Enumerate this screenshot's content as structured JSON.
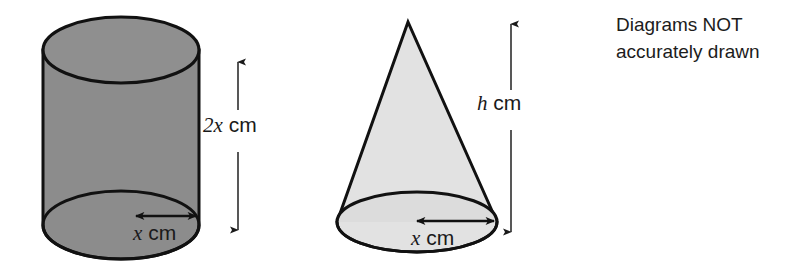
{
  "figure": {
    "title_note": {
      "line1": "Diagrams NOT",
      "line2": "accurately drawn"
    },
    "colors": {
      "cylinder_fill": "#8c8c8c",
      "cylinder_top_fill": "#8f8f8f",
      "cone_fill": "#e2e2e2",
      "cone_base_fill": "#dcdcdc",
      "outline": "#111111",
      "text": "#1a1a1a",
      "background": "#ffffff"
    },
    "shapes": [
      {
        "name": "cylinder",
        "fill": "#8c8c8c",
        "height_label_var": "2x",
        "height_label_unit": " cm",
        "radius_label_var": "x",
        "radius_label_unit": " cm"
      },
      {
        "name": "cone",
        "fill": "#e2e2e2",
        "height_label_var": "h",
        "height_label_unit": " cm",
        "radius_label_var": "x",
        "radius_label_unit": " cm"
      }
    ],
    "labels": {
      "cylinder_height_var": "2x",
      "cylinder_height_unit": "cm",
      "cylinder_radius_var": "x",
      "cylinder_radius_unit": "cm",
      "cone_height_var": "h",
      "cone_height_unit": "cm",
      "cone_radius_var": "x",
      "cone_radius_unit": "cm"
    }
  }
}
